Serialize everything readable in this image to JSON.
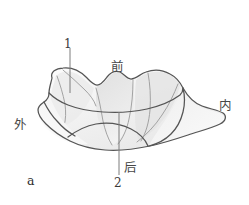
{
  "figure": {
    "panel_label": "a",
    "background_color": "#ffffff",
    "outline_color": "#565656",
    "fill_color": "#f3f3f3",
    "shade_color": "#e2e2e2",
    "leader_line_color": "#8a8a8a"
  },
  "labels": {
    "callout_1": "1",
    "callout_2": "2",
    "anterior": "前",
    "posterior": "后",
    "inner": "内",
    "outer": "外"
  }
}
